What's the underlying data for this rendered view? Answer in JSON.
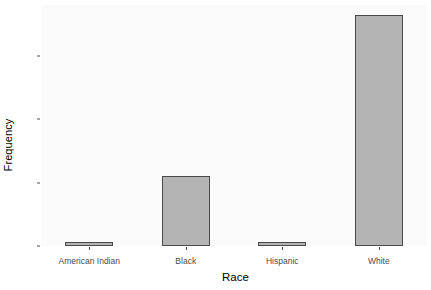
{
  "chart_data": {
    "type": "bar",
    "title": "",
    "subtitle": "",
    "xlabel": "Race",
    "ylabel": "Frequency",
    "categories": [
      "American Indian",
      "Black",
      "Hispanic",
      "White"
    ],
    "values": [
      1,
      22,
      1,
      73
    ],
    "series": [
      {
        "name": "Frequency",
        "values": [
          1,
          22,
          1,
          73
        ]
      }
    ],
    "ylim": [
      0,
      76
    ],
    "ytick_labels": [
      "0",
      "20",
      "40",
      "60"
    ],
    "ytick_values": [
      0,
      20,
      40,
      60
    ],
    "xtick_labels": [
      "American Indian",
      "Black",
      "Hispanic",
      "White"
    ],
    "grid": false,
    "legend": false,
    "legend_position": "none",
    "annotations": [],
    "colors": {
      "bar_fill": "#b4b4b4",
      "bar_border": "#4a4a4a",
      "panel_background": "#fbfbfb",
      "figure_background": "#ffffff",
      "tick_text": "#4d4d4d",
      "axis_title_text": "#000000"
    }
  }
}
